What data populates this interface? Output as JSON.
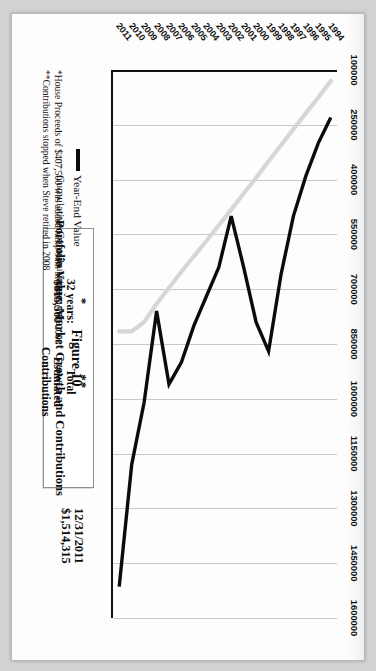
{
  "document": {
    "figure_number": "Figure 10",
    "title": "Portfolio Value: Market Growth and Contributions"
  },
  "callouts": {
    "end_date": "12/31/2011",
    "end_value": "$1,514,315",
    "note_two_marker": "**",
    "note_two_line1": "Total",
    "note_two_line2": "Estimated",
    "note_two_line3": "Contributions",
    "note_one_marker": "*",
    "note_one_line1": "32 years:",
    "note_one_line2": "$815,500"
  },
  "legend": {
    "position": "inside-bottom-left",
    "items": [
      {
        "label": "Year-End Value",
        "color": "#0b0b0b"
      },
      {
        "label": "Cumulative Contributions",
        "color": "#d2d2d2"
      }
    ]
  },
  "footnotes": [
    "*House Proceeds of $407,500 was added lump-sum in summer of 2008",
    "**Contributions stopped when Steve retired in 2008"
  ],
  "chart_data": {
    "type": "line",
    "title": "Portfolio Value: Market Growth and Contributions",
    "xlabel": "",
    "ylabel": "",
    "grid": true,
    "orientation": "rotated-90-clockwise",
    "ylim": [
      100000,
      1600000
    ],
    "yticks": [
      100000,
      250000,
      400000,
      550000,
      700000,
      850000,
      1000000,
      1150000,
      1300000,
      1450000,
      1600000
    ],
    "categories": [
      1994,
      1995,
      1996,
      1997,
      1998,
      1999,
      2000,
      2001,
      2002,
      2003,
      2004,
      2005,
      2006,
      2007,
      2008,
      2009,
      2010,
      2011
    ],
    "series": [
      {
        "name": "Year-End Value",
        "color": "#0b0b0b",
        "values": [
          230000,
          300000,
          390000,
          500000,
          660000,
          870000,
          790000,
          640000,
          500000,
          640000,
          720000,
          800000,
          900000,
          960000,
          760000,
          1010000,
          1180000,
          1514315
        ]
      },
      {
        "name": "Cumulative Contributions",
        "color": "#d2d2d2",
        "values": [
          130000,
          175000,
          218000,
          262000,
          306000,
          350000,
          395000,
          438000,
          482000,
          525000,
          568000,
          610000,
          652000,
          696000,
          740000,
          790000,
          815500,
          815500
        ]
      }
    ],
    "annotations": [
      {
        "text": "12/31/2011 $1,514,315",
        "target": 2011
      },
      {
        "text": "** Total Estimated Contributions",
        "target": 2008
      },
      {
        "text": "* 32 years: $815,500",
        "target": 2010
      }
    ]
  }
}
